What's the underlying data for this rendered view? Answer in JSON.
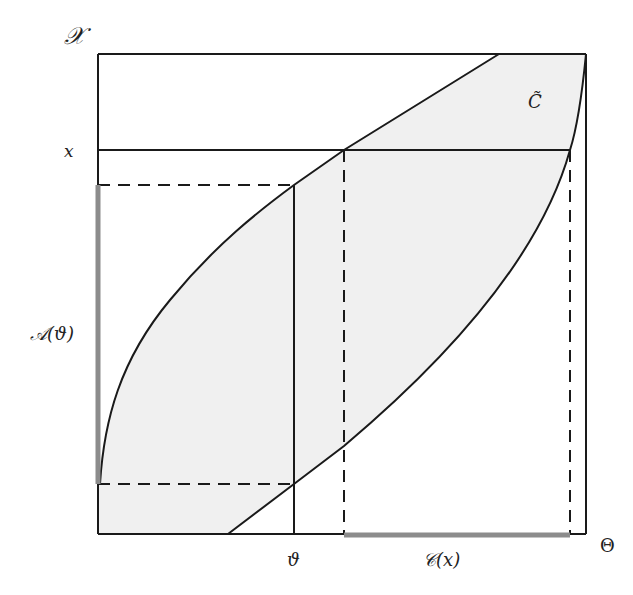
{
  "diagram": {
    "type": "confidence-region-duality",
    "colors": {
      "line": "#1a1a1a",
      "shade": "#f0f0f0",
      "highlight": "#8c8c8c",
      "background": "#ffffff"
    },
    "axes": {
      "y_axis_label": "𝒳",
      "x_axis_label": "Θ"
    },
    "labels": {
      "x_value": "x",
      "theta_value": "ϑ",
      "acceptance_region": "𝒜(ϑ)",
      "confidence_set": "𝒞(x)",
      "region_label": "C̃"
    },
    "elements": [
      {
        "name": "shaded-region",
        "description": "Confidence band C̃ between two increasing curves"
      },
      {
        "name": "x-horizontal-line",
        "description": "Horizontal solid line at observed x"
      },
      {
        "name": "theta-vertical-line",
        "description": "Vertical solid line at ϑ"
      },
      {
        "name": "acceptance-bracket-dashed",
        "description": "Dashed horizontal lines marking 𝒜(ϑ) limits"
      },
      {
        "name": "confidence-bracket-dashed",
        "description": "Dashed vertical lines marking 𝒞(x) limits"
      },
      {
        "name": "acceptance-interval-bar",
        "description": "Grey bar on 𝒳 axis"
      },
      {
        "name": "confidence-interval-bar",
        "description": "Grey bar on Θ axis"
      }
    ]
  }
}
